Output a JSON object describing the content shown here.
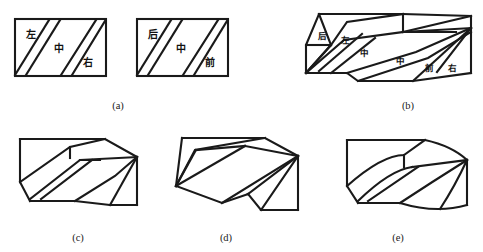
{
  "figure": {
    "type": "geometry-diagram",
    "background_color": "#ffffff",
    "line_color": "#1a1a1a",
    "width": 483,
    "height": 252,
    "panels": [
      {
        "id": "a",
        "caption": "(a)",
        "description": "two flat rectangles each divided by two parallel diagonal strips",
        "rect_left": {
          "labels": [
            "左",
            "中",
            "右"
          ],
          "label_meanings": [
            "left",
            "middle",
            "right"
          ]
        },
        "rect_right": {
          "labels": [
            "后",
            "中",
            "前"
          ],
          "label_meanings": [
            "back",
            "middle",
            "front"
          ]
        }
      },
      {
        "id": "b",
        "caption": "(b)",
        "description": "folded 3D block with all six region labels visible",
        "labels": [
          "后",
          "左",
          "中",
          "中",
          "前",
          "右"
        ],
        "label_meanings": [
          "back",
          "left",
          "middle",
          "middle",
          "front",
          "right"
        ]
      },
      {
        "id": "c",
        "caption": "(c)",
        "description": "folded block option c, straight edges"
      },
      {
        "id": "d",
        "caption": "(d)",
        "description": "folded block option d, fan of creases from left vertex"
      },
      {
        "id": "e",
        "caption": "(e)",
        "description": "folded block option e, curved top and bottom edges"
      }
    ],
    "captions": {
      "a": "(a)",
      "b": "(b)",
      "c": "(c)",
      "d": "(d)",
      "e": "(e)"
    },
    "labels": {
      "zuo": "左",
      "zhong": "中",
      "you": "右",
      "hou": "后",
      "qian": "前"
    }
  }
}
